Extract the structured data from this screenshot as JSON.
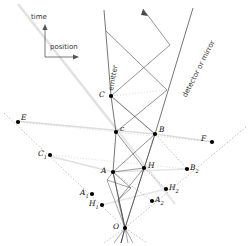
{
  "figure": {
    "background": "#ffffff",
    "width": 251,
    "height": 246
  },
  "axes": {
    "time_label": "time",
    "position_label": "position",
    "origin_px": [
      45,
      57
    ],
    "time_tip_px": [
      45,
      24
    ],
    "position_tip_px": [
      79,
      57
    ],
    "color": "#555555"
  },
  "worldline_labels": [
    {
      "name": "emitter-label",
      "text": "emitter",
      "x": 107,
      "y": 90,
      "rotation": -80,
      "color": "#333333"
    },
    {
      "name": "detector-label",
      "text": "detector or mirror",
      "x": 181,
      "y": 95,
      "rotation": -63,
      "color": "#333333"
    }
  ],
  "points": [
    {
      "id": "C",
      "label": "C",
      "sub": "",
      "x": 111,
      "y": 96,
      "lx": 99,
      "ly": 91
    },
    {
      "id": "c",
      "label": "c",
      "sub": "",
      "x": 116,
      "y": 132,
      "lx": 120,
      "ly": 125
    },
    {
      "id": "B",
      "label": "B",
      "sub": "",
      "x": 155,
      "y": 134,
      "lx": 159,
      "ly": 126
    },
    {
      "id": "A",
      "label": "A",
      "sub": "",
      "x": 113,
      "y": 172,
      "lx": 101,
      "ly": 167
    },
    {
      "id": "H",
      "label": "H",
      "sub": "",
      "x": 144,
      "y": 168,
      "lx": 148,
      "ly": 162
    },
    {
      "id": "O",
      "label": "O",
      "sub": "",
      "x": 125,
      "y": 228,
      "lx": 113,
      "ly": 223
    },
    {
      "id": "E",
      "label": "E",
      "sub": "",
      "x": 18,
      "y": 122,
      "lx": 21,
      "ly": 114
    },
    {
      "id": "F",
      "label": "F",
      "sub": "",
      "x": 212,
      "y": 142,
      "lx": 201,
      "ly": 135
    },
    {
      "id": "C1",
      "label": "C",
      "sub": "1",
      "x": 50,
      "y": 155,
      "lx": 38,
      "ly": 150
    },
    {
      "id": "A1",
      "label": "A",
      "sub": "1",
      "x": 92,
      "y": 194,
      "lx": 80,
      "ly": 189
    },
    {
      "id": "H1",
      "label": "H",
      "sub": "1",
      "x": 102,
      "y": 205,
      "lx": 89,
      "ly": 200
    },
    {
      "id": "B2",
      "label": "B",
      "sub": "2",
      "x": 187,
      "y": 169,
      "lx": 190,
      "ly": 164
    },
    {
      "id": "H2",
      "label": "H",
      "sub": "2",
      "x": 166,
      "y": 189,
      "lx": 169,
      "ly": 184
    },
    {
      "id": "A2",
      "label": "A",
      "sub": "2",
      "x": 152,
      "y": 201,
      "lx": 155,
      "ly": 196
    }
  ],
  "colors": {
    "solid_line": "#3a3a3a",
    "dashed_line": "#8a8a8a",
    "dotted_line": "#a8a8a8",
    "light_line": "#d0d0d0",
    "point_fill": "#000000",
    "text": "#111111"
  },
  "line_groups": {
    "emitter_worldline": "near-vertical line from top through C, c, A to O",
    "detector_worldline": "near-vertical line from top-right through B to O",
    "light_cones": "45-degree light rays forming the lozenge network",
    "simultaneity_dashed": "dashed lines through E, C1, A1, H1, A2, H2, B2, F",
    "faint_diagonal": "pale grey band from upper-left to lower-right"
  }
}
